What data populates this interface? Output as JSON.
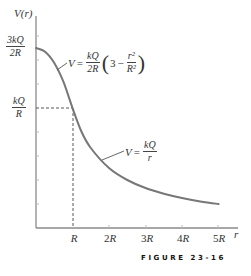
{
  "chart_data": {
    "type": "line",
    "title": "",
    "xlabel": "r",
    "ylabel": "V(r)",
    "x_ticks": [
      "R",
      "2R",
      "3R",
      "4R",
      "5R"
    ],
    "x_tick_values": [
      1,
      2,
      3,
      4,
      5
    ],
    "y_tick_labels": [
      {
        "value": 1.5,
        "num": "3kQ",
        "den": "2R"
      },
      {
        "value": 1.0,
        "num": "kQ",
        "den": "R"
      }
    ],
    "xlim": [
      0,
      5.4
    ],
    "ylim": [
      0,
      1.6
    ],
    "x_units": "R",
    "y_units": "kQ/R",
    "grid": false,
    "legend": "none",
    "series": [
      {
        "name": "V(r)",
        "x": [
          0,
          0.25,
          0.5,
          0.75,
          1.0,
          1.25,
          1.5,
          2.0,
          2.5,
          3.0,
          3.5,
          4.0,
          4.5,
          5.0
        ],
        "y": [
          1.5,
          1.469,
          1.375,
          1.219,
          1.0,
          0.8,
          0.667,
          0.5,
          0.4,
          0.333,
          0.286,
          0.25,
          0.222,
          0.2
        ],
        "color": "#777777"
      }
    ],
    "annotations": [
      {
        "text": "V = kQ/2R (3 − r²/R²)",
        "region": "r < R"
      },
      {
        "text": "V = kQ/r",
        "region": "r > R"
      },
      {
        "text": "dashed guide lines at r = R and V = kQ/R"
      }
    ]
  },
  "labels": {
    "y_axis": "V(r)",
    "x_axis": "r",
    "y_tick_top_num": "3kQ",
    "y_tick_top_den": "2R",
    "y_tick_mid_num": "kQ",
    "y_tick_mid_den": "R",
    "x_tick_1": "R",
    "x_tick_2_coef": "2",
    "x_tick_3_coef": "3",
    "x_tick_4_coef": "4",
    "x_tick_5_coef": "5",
    "x_tick_unit": "R",
    "inner_eq": {
      "lhs": "V",
      "equals": "=",
      "frac_num": "kQ",
      "frac_den": "2R",
      "open": "(",
      "three": "3",
      "minus": "−",
      "r2_num": "r²",
      "r2_den": "R²",
      "close": ")"
    },
    "outer_eq": {
      "lhs": "V",
      "equals": "=",
      "frac_num": "kQ",
      "frac_den": "r"
    }
  },
  "caption": "FIGURE 23-16",
  "colors": {
    "curve": "#7a7a7a",
    "axis": "#8a8a8a",
    "dashed": "#444444",
    "text": "#333333"
  }
}
